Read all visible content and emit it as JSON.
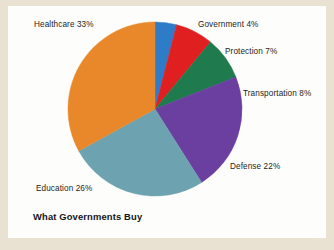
{
  "chart_data": {
    "type": "pie",
    "title": "What Governments Buy",
    "xlabel": "",
    "ylabel": "",
    "legend_position": "none",
    "grid": false,
    "start_angle_deg": 0,
    "direction": "clockwise",
    "categories": [
      "Government",
      "Protection",
      "Transportation",
      "Defense",
      "Education",
      "Healthcare"
    ],
    "values": [
      4,
      7,
      8,
      22,
      26,
      33
    ],
    "unit": "%",
    "total": 100,
    "colors": [
      "#2e7cc8",
      "#e02020",
      "#1f7a4d",
      "#6b3fa0",
      "#6da3b0",
      "#e8882a"
    ],
    "slices": [
      {
        "label": "Government",
        "value": 4,
        "display": "Government 4%",
        "color": "#2e7cc8"
      },
      {
        "label": "Protection",
        "value": 7,
        "display": "Protection 7%",
        "color": "#e02020"
      },
      {
        "label": "Transportation",
        "value": 8,
        "display": "Transportation 8%",
        "color": "#1f7a4d"
      },
      {
        "label": "Defense",
        "value": 22,
        "display": "Defense 22%",
        "color": "#6b3fa0"
      },
      {
        "label": "Education",
        "value": 26,
        "display": "Education 26%",
        "color": "#6da3b0"
      },
      {
        "label": "Healthcare",
        "value": 33,
        "display": "Healthcare 33%",
        "color": "#e8882a"
      }
    ]
  },
  "figure": {
    "background_color": "#fdfdfb",
    "page_color": "#e9e2d2",
    "title": "What Governments Buy"
  }
}
